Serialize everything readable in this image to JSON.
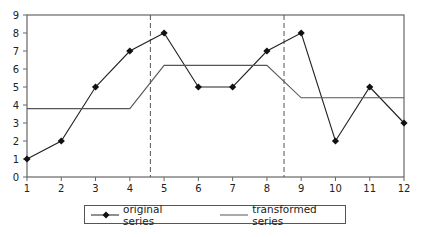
{
  "chart_data": {
    "type": "line",
    "title": "",
    "xlabel": "",
    "ylabel": "",
    "x": [
      1,
      2,
      3,
      4,
      5,
      6,
      7,
      8,
      9,
      10,
      11,
      12
    ],
    "xlim": [
      1,
      12
    ],
    "ylim": [
      0,
      9
    ],
    "yticks": [
      0,
      1,
      2,
      3,
      4,
      5,
      6,
      7,
      8,
      9
    ],
    "xticks": [
      1,
      2,
      3,
      4,
      5,
      6,
      7,
      8,
      9,
      10,
      11,
      12
    ],
    "grid": false,
    "legend_position": "bottom",
    "series": [
      {
        "name": "original series",
        "values": [
          1,
          2,
          5,
          7,
          8,
          5,
          5,
          7,
          8,
          2,
          5,
          3
        ],
        "marker": "diamond",
        "color": "#222222"
      },
      {
        "name": "transformed series",
        "values": [
          3.8,
          3.8,
          3.8,
          3.8,
          6.2,
          6.2,
          6.2,
          6.2,
          4.4,
          4.4,
          4.4,
          4.4
        ],
        "marker": "none",
        "color": "#555555"
      }
    ],
    "annotations": [
      {
        "type": "vertical-dashed-line",
        "x": 4.6
      },
      {
        "type": "vertical-dashed-line",
        "x": 8.5
      }
    ]
  },
  "legend": {
    "items": [
      {
        "label": "original series"
      },
      {
        "label": "transformed series"
      }
    ]
  }
}
